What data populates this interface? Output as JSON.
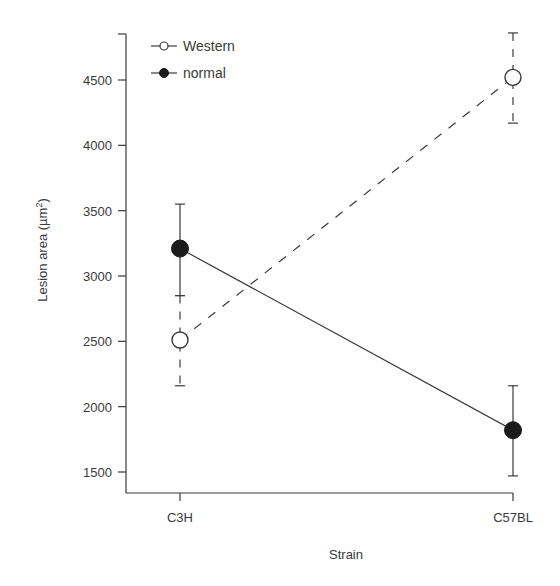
{
  "chart_data": {
    "type": "line",
    "title": "",
    "xlabel": "Strain",
    "ylabel": "Lesion area (µm²)",
    "ylabel_base": "Lesion area (µm",
    "ylabel_sup": "2",
    "ylabel_close": ")",
    "categories": [
      "C3H",
      "C57BL"
    ],
    "yticks": [
      1500,
      2000,
      2500,
      3000,
      3500,
      4000,
      4500
    ],
    "ylim": [
      1330,
      4870
    ],
    "grid": false,
    "legend_position": "upper left",
    "series": [
      {
        "name": "Western",
        "marker": "open-circle",
        "line_style": "dashed",
        "values": [
          2510,
          4520
        ],
        "error_upper": [
          2850,
          4860
        ],
        "error_lower": [
          2160,
          4170
        ]
      },
      {
        "name": "normal",
        "marker": "filled-circle",
        "line_style": "solid",
        "values": [
          3210,
          1820
        ],
        "error_upper": [
          3550,
          2160
        ],
        "error_lower": [
          2850,
          1470
        ]
      }
    ]
  },
  "legend": {
    "items": [
      {
        "label": "Western"
      },
      {
        "label": "normal"
      }
    ]
  },
  "colors": {
    "axis": "#3a3a3a",
    "line": "#3a3a3a",
    "marker_fill_normal": "#1a1a1a",
    "marker_fill_western": "#ffffff"
  }
}
